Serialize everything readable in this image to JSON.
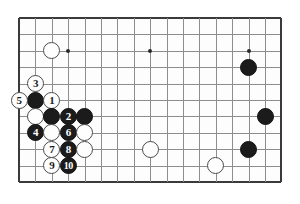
{
  "app": {
    "title": "Go board diagram",
    "type": "go-game-diagram"
  },
  "board": {
    "background_color": "#fdfdfd",
    "line_color": "#8d8d8d",
    "edge_color": "#3a3a3a",
    "black_color": "#1b1b1b",
    "white_color": "#fefefe",
    "columns": 17,
    "rows": 11,
    "origin_x": 19,
    "origin_y": 18,
    "spacing": 16.4,
    "visible_edges": [
      "left",
      "top",
      "right",
      "bottom"
    ],
    "star_points": [
      {
        "col": 3,
        "row": 2
      },
      {
        "col": 8,
        "row": 2
      },
      {
        "col": 14,
        "row": 2
      }
    ],
    "stones": [
      {
        "col": 2,
        "row": 2,
        "color": "white",
        "label": ""
      },
      {
        "col": 14,
        "row": 3,
        "color": "black",
        "label": ""
      },
      {
        "col": 15,
        "row": 6,
        "color": "black",
        "label": ""
      },
      {
        "col": 14,
        "row": 8,
        "color": "black",
        "label": ""
      },
      {
        "col": 8,
        "row": 8,
        "color": "white",
        "label": ""
      },
      {
        "col": 12,
        "row": 9,
        "color": "white",
        "label": ""
      },
      {
        "col": 1,
        "row": 5,
        "color": "black",
        "label": ""
      },
      {
        "col": 1,
        "row": 4,
        "color": "white",
        "label": "3"
      },
      {
        "col": 0,
        "row": 5,
        "color": "white",
        "label": "5"
      },
      {
        "col": 2,
        "row": 5,
        "color": "white",
        "label": "1"
      },
      {
        "col": 1,
        "row": 6,
        "color": "white",
        "label": ""
      },
      {
        "col": 2,
        "row": 6,
        "color": "black",
        "label": ""
      },
      {
        "col": 3,
        "row": 6,
        "color": "black",
        "label": "2"
      },
      {
        "col": 4,
        "row": 6,
        "color": "black",
        "label": ""
      },
      {
        "col": 1,
        "row": 7,
        "color": "black",
        "label": "4"
      },
      {
        "col": 2,
        "row": 7,
        "color": "white",
        "label": ""
      },
      {
        "col": 3,
        "row": 7,
        "color": "black",
        "label": "6"
      },
      {
        "col": 4,
        "row": 7,
        "color": "white",
        "label": ""
      },
      {
        "col": 2,
        "row": 8,
        "color": "white",
        "label": "7"
      },
      {
        "col": 3,
        "row": 8,
        "color": "black",
        "label": "8"
      },
      {
        "col": 4,
        "row": 8,
        "color": "white",
        "label": ""
      },
      {
        "col": 2,
        "row": 9,
        "color": "white",
        "label": "9"
      },
      {
        "col": 3,
        "row": 9,
        "color": "black",
        "label": "10"
      }
    ]
  }
}
